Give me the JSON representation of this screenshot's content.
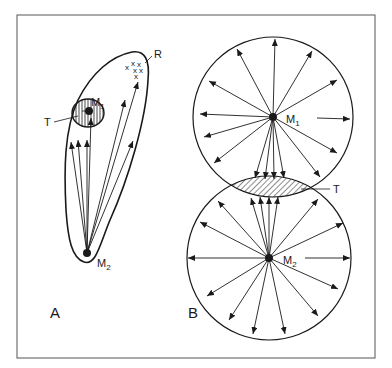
{
  "figure": {
    "panels": [
      {
        "id": "A",
        "label": "A",
        "labels": {
          "M1": "M",
          "M1_sub": "1",
          "M2": "M",
          "M2_sub": "2",
          "T": "T",
          "R": "R"
        },
        "description": "Elongated field around M2 with arrows directed toward M1 (hatched zone T) and toward a cluster R of x marks"
      },
      {
        "id": "B",
        "label": "B",
        "labels": {
          "M1": "M",
          "M1_sub": "1",
          "M2": "M",
          "M2_sub": "2",
          "T": "T"
        },
        "description": "Two overlapping circular fields centred on M1 and M2 with radial arrows; overlap zone T is hatched"
      }
    ],
    "colors": {
      "ink": "#1a1a1a",
      "frame": "#555555",
      "background": "#ffffff"
    }
  }
}
